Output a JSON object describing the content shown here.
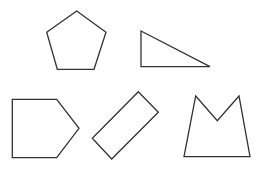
{
  "diagram": {
    "background": "#ffffff",
    "stroke_color": "#333333",
    "fill_color": "#ffffff",
    "shapes": [
      {
        "name": "regular-pentagon",
        "type": "pentagon",
        "points": "76.7,11 106,32.3 94,69.3 57.3,69.3 46.7,32.3"
      },
      {
        "name": "right-triangle",
        "type": "triangle",
        "points": "141,31 210,66.7 141,66.7"
      },
      {
        "name": "house-pentagon",
        "type": "pentagon",
        "points": "12.3,99.3 56.7,99.3 79,128.3 56.7,157.7 12.3,157.7"
      },
      {
        "name": "rotated-rectangle",
        "type": "rectangle",
        "points": "138.3,91.7 158.3,112.3 111.7,159 92.3,138.3"
      },
      {
        "name": "m-shape-pentagon",
        "type": "concave-pentagon",
        "points": "195.7,96 217.3,120.7 239,96 250,156.7 184,156.7"
      }
    ]
  }
}
